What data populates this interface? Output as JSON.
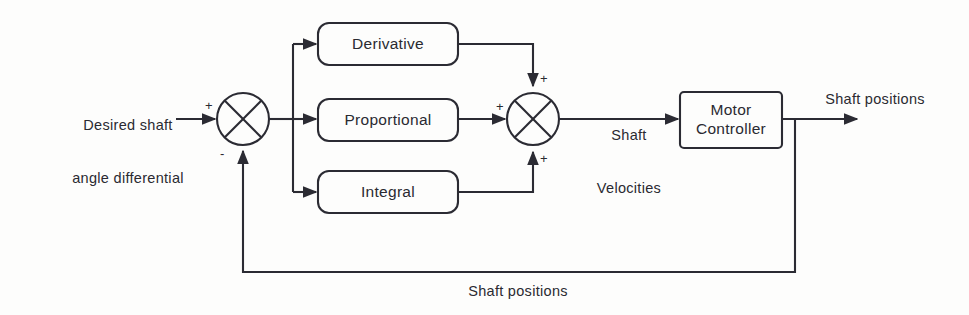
{
  "diagram": {
    "stroke_color": "#2b2b33",
    "background_color": "#fdfdfc",
    "text_color": "#2a2a31",
    "blocks": [
      {
        "id": "derivative",
        "label": "Derivative"
      },
      {
        "id": "proportional",
        "label": "Proportional"
      },
      {
        "id": "integral",
        "label": "Integral"
      },
      {
        "id": "motor_controller",
        "label_line1": "Motor",
        "label_line2": "Controller"
      }
    ],
    "junctions": [
      {
        "id": "error-junction",
        "name": "summing-junction-error",
        "signs": {
          "input": "+",
          "feedback": "-"
        }
      },
      {
        "id": "sum-junction",
        "name": "summing-junction-pid",
        "signs": {
          "top": "+",
          "left": "+",
          "bottom": "+"
        }
      }
    ],
    "signals": {
      "input_line1": "Desired shaft",
      "input_line2": "angle differential",
      "velocities_line1": "Shaft",
      "velocities_line2": "Velocities",
      "output": "Shaft positions",
      "feedback": "Shaft positions"
    },
    "signs": {
      "input_plus": "+",
      "feedback_minus": "-",
      "derivative_plus": "+",
      "proportional_plus": "+",
      "integral_plus": "+"
    }
  }
}
